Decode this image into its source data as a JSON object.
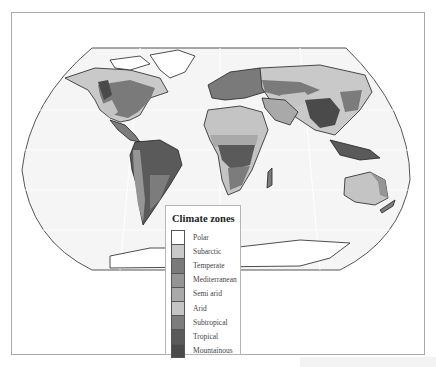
{
  "map": {
    "projection": "world",
    "background_color": "#ffffff",
    "ocean_color": "#f4f4f4",
    "coast_color": "#2a2a2a"
  },
  "legend": {
    "title": "Climate zones",
    "items": [
      {
        "label": "Polar",
        "color": "#ffffff"
      },
      {
        "label": "Subarctic",
        "color": "#c9c9c9"
      },
      {
        "label": "Temperate",
        "color": "#7a7a7a"
      },
      {
        "label": "Mediterranean",
        "color": "#959595"
      },
      {
        "label": "Semi arid",
        "color": "#a9a9a9"
      },
      {
        "label": "Arid",
        "color": "#c4c4c4"
      },
      {
        "label": "Subtropical",
        "color": "#7c7c7c"
      },
      {
        "label": "Tropical",
        "color": "#5a5a5a"
      },
      {
        "label": "Mountainous",
        "color": "#4a4a4a"
      }
    ]
  }
}
